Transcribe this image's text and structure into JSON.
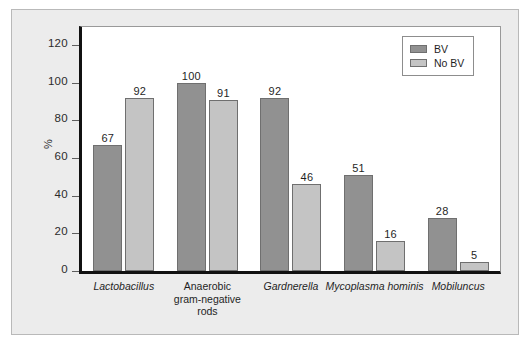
{
  "chart_data": {
    "type": "bar",
    "title": "",
    "xlabel": "",
    "ylabel": "%",
    "ylim": [
      0,
      130
    ],
    "yticks": [
      0,
      20,
      40,
      60,
      80,
      100,
      120
    ],
    "ytick_labels": [
      "0",
      "20",
      "40",
      "60",
      "80",
      "100",
      "120"
    ],
    "grid": false,
    "legend_position": "top-right",
    "categories": [
      "Lactobacillus",
      "Anaerobic gram-negative rods",
      "Gardnerella",
      "Mycoplasma hominis",
      "Mobiluncus"
    ],
    "category_lines": [
      [
        "Lactobacillus"
      ],
      [
        "Anaerobic",
        "gram-negative",
        "rods"
      ],
      [
        "Gardnerella"
      ],
      [
        "Mycoplasma hominis"
      ],
      [
        "Mobiluncus"
      ]
    ],
    "category_italic": [
      true,
      false,
      true,
      true,
      true
    ],
    "series": [
      {
        "name": "BV",
        "color": "#919191",
        "values": [
          67,
          100,
          92,
          51,
          28
        ]
      },
      {
        "name": "No BV",
        "color": "#c4c4c4",
        "values": [
          92,
          91,
          46,
          16,
          5
        ]
      }
    ]
  },
  "legend": {
    "items": [
      {
        "label": "BV"
      },
      {
        "label": "No BV"
      }
    ]
  }
}
